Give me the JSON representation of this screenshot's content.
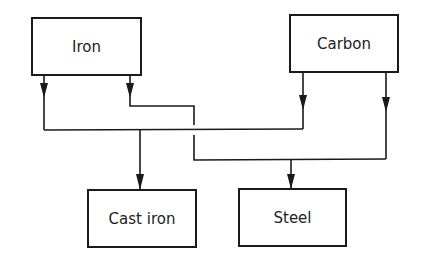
{
  "diagram": {
    "type": "flow",
    "colors": {
      "stroke": "#1a1a1a",
      "text": "#222222",
      "background": "#ffffff"
    },
    "nodes": {
      "iron": {
        "label": "Iron"
      },
      "carbon": {
        "label": "Carbon"
      },
      "cast_iron": {
        "label": "Cast iron"
      },
      "steel": {
        "label": "Steel"
      }
    },
    "edges": [
      {
        "from": "Iron",
        "to": "Cast iron"
      },
      {
        "from": "Carbon",
        "to": "Cast iron"
      },
      {
        "from": "Iron",
        "to": "Steel"
      },
      {
        "from": "Carbon",
        "to": "Steel"
      }
    ]
  }
}
